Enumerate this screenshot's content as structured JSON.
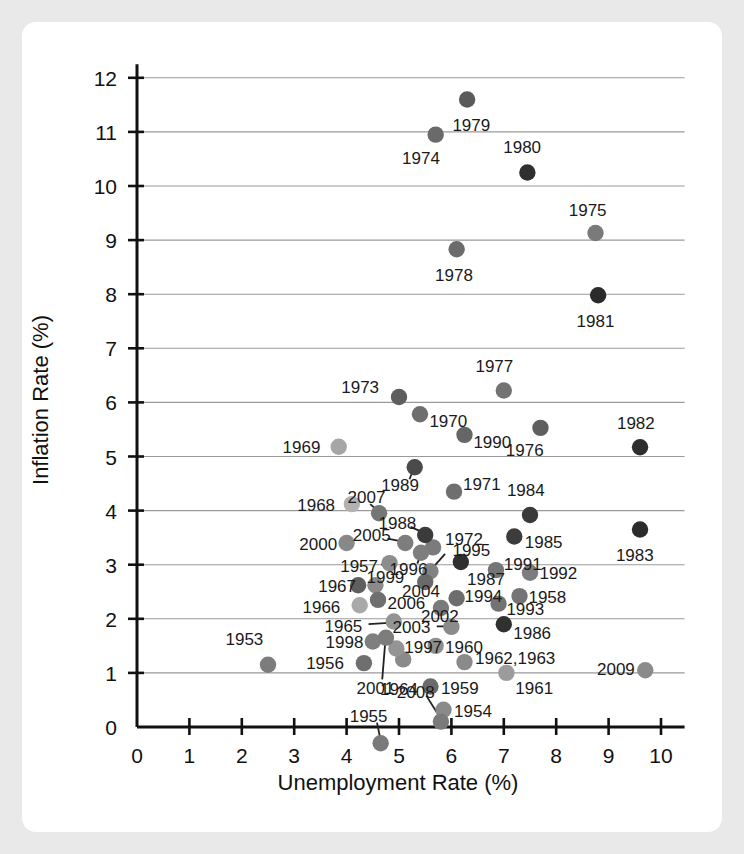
{
  "chart_data": {
    "type": "scatter",
    "title": "",
    "xlabel": "Unemployment Rate (%)",
    "ylabel": "Inflation Rate (%)",
    "xlim": [
      0,
      10.6
    ],
    "ylim": [
      -0.45,
      12.4
    ],
    "xticks": [
      "0",
      "1",
      "2",
      "3",
      "4",
      "5",
      "6",
      "7",
      "8",
      "9",
      "10"
    ],
    "yticks": [
      "0",
      "1",
      "2",
      "3",
      "4",
      "5",
      "6",
      "7",
      "8",
      "9",
      "10",
      "11",
      "12"
    ],
    "grid": "horizontal",
    "legend": "none",
    "points": [
      {
        "label": "1953",
        "x": 2.5,
        "y": 1.15,
        "shade": "#7c7c7c",
        "lx": 2.05,
        "ly": 1.62,
        "anchor": "middle"
      },
      {
        "label": "1954",
        "x": 5.85,
        "y": 0.32,
        "shade": "#8a8a8a",
        "lx": 6.05,
        "ly": 0.3,
        "anchor": "start"
      },
      {
        "label": "1955",
        "x": 4.65,
        "y": -0.3,
        "shade": "#7a7a7a",
        "lx": 4.42,
        "ly": 0.2,
        "anchor": "middle"
      },
      {
        "label": "1956",
        "x": 4.33,
        "y": 1.18,
        "shade": "#6f6f6f",
        "lx": 3.95,
        "ly": 1.18,
        "anchor": "end"
      },
      {
        "label": "1957",
        "x": 4.82,
        "y": 3.03,
        "shade": "#8d8d8d",
        "lx": 4.6,
        "ly": 2.97,
        "anchor": "end"
      },
      {
        "label": "1958",
        "x": 7.3,
        "y": 2.42,
        "shade": "#757575",
        "lx": 7.47,
        "ly": 2.4,
        "anchor": "start"
      },
      {
        "label": "1959",
        "x": 5.6,
        "y": 0.75,
        "shade": "#6b6b6b",
        "lx": 5.8,
        "ly": 0.72,
        "anchor": "start"
      },
      {
        "label": "1960",
        "x": 5.7,
        "y": 1.5,
        "shade": "#8f8f8f",
        "lx": 5.88,
        "ly": 1.48,
        "anchor": "start"
      },
      {
        "label": "1961",
        "x": 7.05,
        "y": 1.0,
        "shade": "#9c9c9c",
        "lx": 7.22,
        "ly": 0.73,
        "anchor": "start"
      },
      {
        "label": "1962,1963",
        "x": 6.25,
        "y": 1.2,
        "shade": "#8a8a8a",
        "lx": 6.45,
        "ly": 1.28,
        "anchor": "start"
      },
      {
        "label": "1964",
        "x": 5.08,
        "y": 1.25,
        "shade": "#8a8a8a",
        "lx": 5.0,
        "ly": 0.7,
        "anchor": "middle"
      },
      {
        "label": "1965",
        "x": 4.9,
        "y": 1.95,
        "shade": "#949494",
        "lx": 4.3,
        "ly": 1.87,
        "anchor": "end"
      },
      {
        "label": "1966",
        "x": 4.25,
        "y": 2.25,
        "shade": "#a9a9a9",
        "lx": 3.88,
        "ly": 2.22,
        "anchor": "end"
      },
      {
        "label": "1967",
        "x": 4.55,
        "y": 2.62,
        "shade": "#8a8a8a",
        "lx": 4.18,
        "ly": 2.6,
        "anchor": "end"
      },
      {
        "label": "1968",
        "x": 4.1,
        "y": 4.12,
        "shade": "#b2b2b2",
        "lx": 3.78,
        "ly": 4.1,
        "anchor": "end"
      },
      {
        "label": "1969",
        "x": 3.85,
        "y": 5.18,
        "shade": "#a6a6a6",
        "lx": 3.5,
        "ly": 5.18,
        "anchor": "end"
      },
      {
        "label": "1970",
        "x": 5.4,
        "y": 5.78,
        "shade": "#6e6e6e",
        "lx": 5.58,
        "ly": 5.65,
        "anchor": "start"
      },
      {
        "label": "1971",
        "x": 6.05,
        "y": 4.35,
        "shade": "#6f6f6f",
        "lx": 6.22,
        "ly": 4.5,
        "anchor": "start"
      },
      {
        "label": "1972",
        "x": 5.65,
        "y": 3.32,
        "shade": "#7b7b7b",
        "lx": 5.88,
        "ly": 3.48,
        "anchor": "start"
      },
      {
        "label": "1973",
        "x": 5.0,
        "y": 6.1,
        "shade": "#5e5e5e",
        "lx": 4.62,
        "ly": 6.28,
        "anchor": "end"
      },
      {
        "label": "1974",
        "x": 5.7,
        "y": 10.95,
        "shade": "#6a6a6a",
        "lx": 5.42,
        "ly": 10.52,
        "anchor": "middle"
      },
      {
        "label": "1975",
        "x": 8.75,
        "y": 9.13,
        "shade": "#7a7a7a",
        "lx": 8.6,
        "ly": 9.55,
        "anchor": "middle"
      },
      {
        "label": "1976",
        "x": 7.7,
        "y": 5.53,
        "shade": "#5f5f5f",
        "lx": 7.4,
        "ly": 5.12,
        "anchor": "middle"
      },
      {
        "label": "1977",
        "x": 7.0,
        "y": 6.22,
        "shade": "#737373",
        "lx": 6.82,
        "ly": 6.68,
        "anchor": "middle"
      },
      {
        "label": "1978",
        "x": 6.1,
        "y": 8.83,
        "shade": "#6b6b6b",
        "lx": 6.05,
        "ly": 8.35,
        "anchor": "middle"
      },
      {
        "label": "1979",
        "x": 6.3,
        "y": 11.6,
        "shade": "#5a5a5a",
        "lx": 6.38,
        "ly": 11.12,
        "anchor": "middle"
      },
      {
        "label": "1980",
        "x": 7.45,
        "y": 10.25,
        "shade": "#2f2f2f",
        "lx": 7.35,
        "ly": 10.72,
        "anchor": "middle"
      },
      {
        "label": "1981",
        "x": 8.8,
        "y": 7.98,
        "shade": "#2b2b2b",
        "lx": 8.75,
        "ly": 7.5,
        "anchor": "middle"
      },
      {
        "label": "1982",
        "x": 9.6,
        "y": 5.17,
        "shade": "#2e2e2e",
        "lx": 9.52,
        "ly": 5.62,
        "anchor": "middle"
      },
      {
        "label": "1983",
        "x": 9.6,
        "y": 3.65,
        "shade": "#2c2c2c",
        "lx": 9.5,
        "ly": 3.18,
        "anchor": "middle"
      },
      {
        "label": "1984",
        "x": 7.5,
        "y": 3.92,
        "shade": "#3a3a3a",
        "lx": 7.42,
        "ly": 4.38,
        "anchor": "middle"
      },
      {
        "label": "1985",
        "x": 7.2,
        "y": 3.52,
        "shade": "#3c3c3c",
        "lx": 7.4,
        "ly": 3.42,
        "anchor": "start"
      },
      {
        "label": "1986",
        "x": 7.0,
        "y": 1.9,
        "shade": "#303030",
        "lx": 7.18,
        "ly": 1.73,
        "anchor": "start"
      },
      {
        "label": "1987",
        "x": 6.18,
        "y": 3.05,
        "shade": "#2f2f2f",
        "lx": 6.3,
        "ly": 2.73,
        "anchor": "start"
      },
      {
        "label": "1988",
        "x": 5.5,
        "y": 3.55,
        "shade": "#3b3b3b",
        "lx": 4.97,
        "ly": 3.78,
        "anchor": "middle"
      },
      {
        "label": "1989",
        "x": 5.3,
        "y": 4.8,
        "shade": "#4a4a4a",
        "lx": 5.02,
        "ly": 4.48,
        "anchor": "middle"
      },
      {
        "label": "1990",
        "x": 6.25,
        "y": 5.4,
        "shade": "#666666",
        "lx": 6.42,
        "ly": 5.27,
        "anchor": "start"
      },
      {
        "label": "1991",
        "x": 6.85,
        "y": 2.9,
        "shade": "#757575",
        "lx": 7.0,
        "ly": 3.02,
        "anchor": "start"
      },
      {
        "label": "1992",
        "x": 7.5,
        "y": 2.85,
        "shade": "#7d7d7d",
        "lx": 7.68,
        "ly": 2.85,
        "anchor": "start"
      },
      {
        "label": "1993",
        "x": 6.9,
        "y": 2.28,
        "shade": "#737373",
        "lx": 7.05,
        "ly": 2.18,
        "anchor": "start"
      },
      {
        "label": "1994",
        "x": 6.1,
        "y": 2.38,
        "shade": "#6d6d6d",
        "lx": 6.25,
        "ly": 2.42,
        "anchor": "start"
      },
      {
        "label": "1995",
        "x": 5.6,
        "y": 2.88,
        "shade": "#828282",
        "lx": 6.02,
        "ly": 3.27,
        "anchor": "start"
      },
      {
        "label": "1996",
        "x": 5.42,
        "y": 3.22,
        "shade": "#7e7e7e",
        "lx": 5.18,
        "ly": 2.92,
        "anchor": "middle"
      },
      {
        "label": "1997",
        "x": 4.95,
        "y": 1.45,
        "shade": "#949494",
        "lx": 5.1,
        "ly": 1.48,
        "anchor": "start"
      },
      {
        "label": "1998",
        "x": 4.5,
        "y": 1.58,
        "shade": "#7f7f7f",
        "lx": 4.32,
        "ly": 1.58,
        "anchor": "end"
      },
      {
        "label": "1999",
        "x": 4.22,
        "y": 2.62,
        "shade": "#5f5f5f",
        "lx": 4.38,
        "ly": 2.78,
        "anchor": "start"
      },
      {
        "label": "2000",
        "x": 4.0,
        "y": 3.4,
        "shade": "#888888",
        "lx": 3.82,
        "ly": 3.38,
        "anchor": "end"
      },
      {
        "label": "2001",
        "x": 4.75,
        "y": 1.65,
        "shade": "#7c7c7c",
        "lx": 4.55,
        "ly": 0.72,
        "anchor": "middle"
      },
      {
        "label": "2002",
        "x": 5.8,
        "y": 2.2,
        "shade": "#7a7a7a",
        "lx": 5.78,
        "ly": 2.05,
        "anchor": "middle"
      },
      {
        "label": "2003",
        "x": 6.0,
        "y": 1.85,
        "shade": "#8b8b8b",
        "lx": 5.6,
        "ly": 1.85,
        "anchor": "end"
      },
      {
        "label": "2004",
        "x": 5.5,
        "y": 2.68,
        "shade": "#6a6a6a",
        "lx": 5.42,
        "ly": 2.52,
        "anchor": "middle"
      },
      {
        "label": "2005",
        "x": 5.12,
        "y": 3.4,
        "shade": "#7d7d7d",
        "lx": 4.48,
        "ly": 3.55,
        "anchor": "middle"
      },
      {
        "label": "2006",
        "x": 4.6,
        "y": 2.35,
        "shade": "#6f6f6f",
        "lx": 4.78,
        "ly": 2.3,
        "anchor": "start"
      },
      {
        "label": "2007",
        "x": 4.62,
        "y": 3.95,
        "shade": "#767676",
        "lx": 4.38,
        "ly": 4.25,
        "anchor": "middle"
      },
      {
        "label": "2008",
        "x": 5.8,
        "y": 0.1,
        "shade": "#7a7a7a",
        "lx": 5.32,
        "ly": 0.65,
        "anchor": "middle"
      },
      {
        "label": "2009",
        "x": 9.7,
        "y": 1.05,
        "shade": "#8b8b8b",
        "lx": 9.5,
        "ly": 1.07,
        "anchor": "end"
      }
    ],
    "leaders": [
      {
        "label": "1988",
        "x1": 5.22,
        "y1": 3.7,
        "x2": 5.5,
        "y2": 3.58
      },
      {
        "label": "1989",
        "x1": 5.2,
        "y1": 4.58,
        "x2": 5.3,
        "y2": 4.82
      },
      {
        "label": "2007",
        "x1": 4.45,
        "y1": 4.12,
        "x2": 4.62,
        "y2": 3.98
      },
      {
        "label": "2005",
        "x1": 4.78,
        "y1": 3.48,
        "x2": 5.1,
        "y2": 3.42
      },
      {
        "label": "1996",
        "x1": 5.35,
        "y1": 3.02,
        "x2": 5.42,
        "y2": 3.2
      },
      {
        "label": "1995",
        "x1": 5.88,
        "y1": 3.2,
        "x2": 5.62,
        "y2": 2.92
      },
      {
        "label": "2001",
        "x1": 4.68,
        "y1": 0.88,
        "x2": 4.74,
        "y2": 1.6
      },
      {
        "label": "2008",
        "x1": 5.52,
        "y1": 0.58,
        "x2": 5.78,
        "y2": 0.18
      },
      {
        "label": "1965",
        "x1": 4.42,
        "y1": 1.9,
        "x2": 4.88,
        "y2": 1.93
      },
      {
        "label": "2003",
        "x1": 5.72,
        "y1": 1.86,
        "x2": 5.97,
        "y2": 1.86
      },
      {
        "label": "1957",
        "x1": 4.66,
        "y1": 3.0,
        "x2": 4.8,
        "y2": 3.02
      },
      {
        "label": "1955",
        "x1": 4.58,
        "y1": 0.08,
        "x2": 4.64,
        "y2": -0.2
      }
    ]
  }
}
